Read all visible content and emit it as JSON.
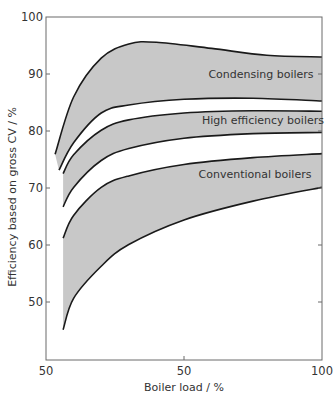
{
  "chart_data": {
    "type": "area",
    "title": "",
    "xlabel": "Boiler load / %",
    "ylabel": "Efficiency based on gross CV / %",
    "xlim": [
      0,
      100
    ],
    "ylim": [
      40,
      100
    ],
    "x_ticks": [
      {
        "value": 0,
        "label": "50"
      },
      {
        "value": 50,
        "label": "50"
      },
      {
        "value": 100,
        "label": "100"
      }
    ],
    "y_ticks": [
      {
        "value": 100,
        "label": "100"
      },
      {
        "value": 90,
        "label": "90"
      },
      {
        "value": 80,
        "label": "80"
      },
      {
        "value": 70,
        "label": "70"
      },
      {
        "value": 60,
        "label": "60"
      },
      {
        "value": 50,
        "label": "50"
      }
    ],
    "grid": false,
    "legend": "none (bands labelled inline)",
    "fill_color": "#c8c8c8",
    "line_color": "#1a1a1a",
    "series": [
      {
        "name": "Condensing boilers",
        "upper": {
          "x": [
            3.3,
            10,
            20,
            30,
            40,
            60,
            80,
            100
          ],
          "y": [
            76.0,
            86.0,
            92.8,
            95.3,
            95.6,
            94.5,
            93.3,
            93.0
          ]
        },
        "lower": {
          "x": [
            4.7,
            10,
            20,
            30,
            50,
            75,
            100
          ],
          "y": [
            73.2,
            78.0,
            83.2,
            84.6,
            85.6,
            85.8,
            85.3
          ]
        }
      },
      {
        "name": "High efficiency boilers",
        "upper": {
          "x": [
            6.2,
            10,
            20,
            30,
            50,
            75,
            100
          ],
          "y": [
            72.6,
            75.9,
            80.2,
            82.0,
            83.2,
            83.6,
            83.5
          ]
        },
        "lower": {
          "x": [
            6.2,
            10,
            20,
            30,
            50,
            75,
            100
          ],
          "y": [
            66.8,
            70.2,
            74.9,
            77.0,
            78.8,
            79.6,
            79.8
          ]
        }
      },
      {
        "name": "Conventional boilers",
        "upper": {
          "x": [
            6.2,
            10,
            20,
            30,
            50,
            75,
            100
          ],
          "y": [
            61.3,
            65.3,
            70.2,
            72.2,
            74.2,
            75.4,
            76.1
          ]
        },
        "lower": {
          "x": [
            6.2,
            10,
            20,
            30,
            50,
            75,
            100
          ],
          "y": [
            45.3,
            50.8,
            56.4,
            60.2,
            64.5,
            67.8,
            70.2
          ]
        }
      }
    ]
  },
  "labels": {
    "condensing": "Condensing boilers",
    "high_efficiency": "High efficiency boilers",
    "conventional": "Conventional boilers",
    "xlabel": "Boiler load / %",
    "ylabel": "Efficiency based on gross CV / %",
    "xtick_0": "50",
    "xtick_50": "50",
    "xtick_100": "100",
    "ytick_100": "100",
    "ytick_90": "90",
    "ytick_80": "80",
    "ytick_70": "70",
    "ytick_60": "60",
    "ytick_50": "50"
  }
}
